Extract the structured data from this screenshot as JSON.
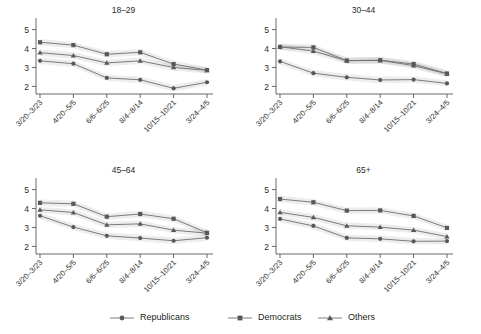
{
  "chart_data": {
    "type": "line",
    "title": "",
    "subtitle": "",
    "xlabel": "",
    "ylabel": "",
    "ylim": [
      1.6,
      5.4
    ],
    "yticks": [
      2,
      3,
      4,
      5
    ],
    "ytick_labels": [
      "2",
      "3",
      "4",
      "5"
    ],
    "grid": false,
    "legend_position": "bottom",
    "categories": [
      "3/20–3/23",
      "4/20–5/5",
      "6/6–6/25",
      "8/4–8/14",
      "10/15–10/21",
      "3/24–4/5"
    ],
    "legend": [
      "Republicans",
      "Democrats",
      "Others"
    ],
    "markers": [
      "circle",
      "square",
      "triangle"
    ],
    "panels": [
      {
        "title": "18–29",
        "series": [
          {
            "name": "Republicans",
            "marker": "circle",
            "values": [
              3.35,
              3.2,
              2.45,
              2.35,
              1.9,
              2.22
            ]
          },
          {
            "name": "Democrats",
            "marker": "square",
            "values": [
              4.33,
              4.18,
              3.7,
              3.8,
              3.18,
              2.86
            ]
          },
          {
            "name": "Others",
            "marker": "triangle",
            "values": [
              3.78,
              3.63,
              3.24,
              3.35,
              3.0,
              2.85
            ]
          }
        ]
      },
      {
        "title": "30–44",
        "series": [
          {
            "name": "Republicans",
            "marker": "circle",
            "values": [
              3.32,
              2.7,
              2.48,
              2.34,
              2.36,
              2.16
            ]
          },
          {
            "name": "Democrats",
            "marker": "square",
            "values": [
              4.08,
              4.06,
              3.36,
              3.38,
              3.18,
              2.68
            ]
          },
          {
            "name": "Others",
            "marker": "triangle",
            "values": [
              4.1,
              3.86,
              3.36,
              3.38,
              3.1,
              2.66
            ]
          }
        ]
      },
      {
        "title": "45–64",
        "series": [
          {
            "name": "Republicans",
            "marker": "circle",
            "values": [
              3.62,
              3.02,
              2.56,
              2.44,
              2.3,
              2.46
            ]
          },
          {
            "name": "Democrats",
            "marker": "square",
            "values": [
              4.3,
              4.25,
              3.57,
              3.71,
              3.46,
              2.72
            ]
          },
          {
            "name": "Others",
            "marker": "triangle",
            "values": [
              3.93,
              3.79,
              3.14,
              3.19,
              2.86,
              2.7
            ]
          }
        ]
      },
      {
        "title": "65+",
        "series": [
          {
            "name": "Republicans",
            "marker": "circle",
            "values": [
              3.45,
              3.08,
              2.45,
              2.4,
              2.27,
              2.28
            ]
          },
          {
            "name": "Democrats",
            "marker": "square",
            "values": [
              4.5,
              4.33,
              3.89,
              3.9,
              3.61,
              2.98
            ]
          },
          {
            "name": "Others",
            "marker": "triangle",
            "values": [
              3.8,
              3.53,
              3.09,
              3.02,
              2.86,
              2.52
            ]
          }
        ]
      }
    ]
  }
}
